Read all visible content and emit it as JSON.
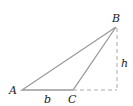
{
  "diagram": {
    "type": "triangle",
    "vertices": {
      "A": {
        "label": "A"
      },
      "B": {
        "label": "B"
      },
      "C": {
        "label": "C"
      }
    },
    "side_label": "b",
    "height_label": "h",
    "colors": {
      "triangle_stroke": "#9a9a9a",
      "dashed_stroke": "#aaaaaa",
      "text": "#222222"
    }
  }
}
